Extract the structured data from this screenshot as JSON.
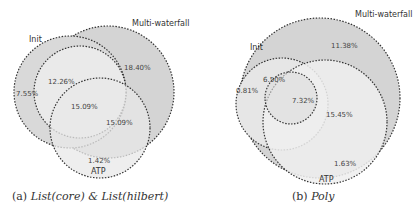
{
  "figures": [
    {
      "caption_prefix": "(a)",
      "caption_text": "List(core) & List(hilbert)",
      "sets": {
        "init": "Init",
        "multi": "Multi-waterfall",
        "atp": "ATP"
      },
      "regions": {
        "init_only": "7.55%",
        "init_multi": "12.26%",
        "multi_only": "18.40%",
        "all_three": "15.09%",
        "multi_atp": "15.09%",
        "atp_only": "1.42%"
      }
    },
    {
      "caption_prefix": "(b)",
      "caption_text": "Poly",
      "sets": {
        "init": "Init",
        "multi": "Multi-waterfall",
        "atp": "ATP"
      },
      "regions": {
        "init_only": "0.81%",
        "init_multi": "6.50%",
        "multi_only": "11.38%",
        "all_three": "7.32%",
        "multi_atp": "15.45%",
        "atp_only": "1.63%"
      }
    }
  ],
  "colors": {
    "outer": "#d4d4d4",
    "mid": "#e6e6e6",
    "inner": "#eeeeee",
    "stroke": "#333333"
  }
}
